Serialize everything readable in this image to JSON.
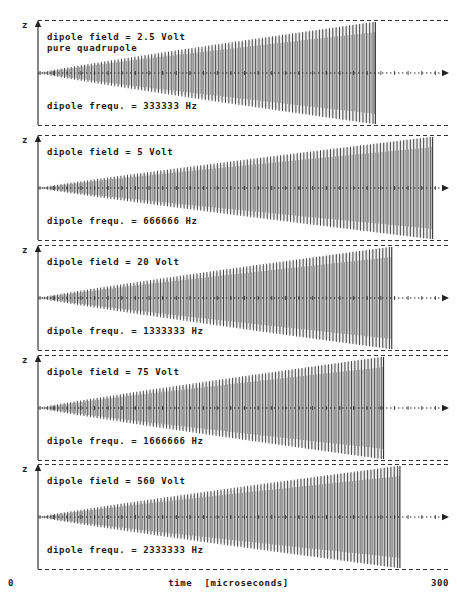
{
  "figure": {
    "yaxis_label": "z",
    "xaxis": {
      "title": "time  [microseconds]",
      "min_label": "0",
      "max_label": "300"
    }
  },
  "chart_data": {
    "type": "line",
    "title": "",
    "xlabel": "time  [microseconds]",
    "ylabel": "z",
    "xlim": [
      0,
      300
    ],
    "grid": false,
    "legend_position": "none",
    "panel_count": 5,
    "shared_x": [
      0,
      300
    ],
    "panels": [
      {
        "index": 1,
        "field_label": "dipole field = 2.5 Volt",
        "sub_label": "pure quadrupole",
        "freq_label": "dipole frequ. = 333333 Hz",
        "dipole_field_volt": 2.5,
        "dipole_frequency_hz": 333333,
        "eject_time_us": 246,
        "oscillation_cycles": 100,
        "envelope": "linear-growth-then-flat",
        "max_amplitude_fraction": 1.0
      },
      {
        "index": 2,
        "field_label": "dipole field = 5 Volt",
        "sub_label": "",
        "freq_label": "dipole frequ. = 666666 Hz",
        "dipole_field_volt": 5,
        "dipole_frequency_hz": 666666,
        "eject_time_us": 288,
        "oscillation_cycles": 118,
        "envelope": "linear-growth-then-flat",
        "max_amplitude_fraction": 1.0
      },
      {
        "index": 3,
        "field_label": "dipole field = 20 Volt",
        "sub_label": "",
        "freq_label": "dipole frequ. = 1333333 Hz",
        "dipole_field_volt": 20,
        "dipole_frequency_hz": 1333333,
        "eject_time_us": 258,
        "oscillation_cycles": 106,
        "envelope": "linear-growth-then-flat",
        "max_amplitude_fraction": 1.0
      },
      {
        "index": 4,
        "field_label": "dipole field = 75 Volt",
        "sub_label": "",
        "freq_label": "dipole frequ. = 1666666 Hz",
        "dipole_field_volt": 75,
        "dipole_frequency_hz": 1666666,
        "eject_time_us": 252,
        "oscillation_cycles": 104,
        "envelope": "linear-growth-then-flat",
        "max_amplitude_fraction": 1.0
      },
      {
        "index": 5,
        "field_label": "dipole field = 560 Volt",
        "sub_label": "",
        "freq_label": "dipole frequ. = 2333333 Hz",
        "dipole_field_volt": 560,
        "dipole_frequency_hz": 2333333,
        "eject_time_us": 264,
        "oscillation_cycles": 108,
        "envelope": "linear-growth-then-flat",
        "max_amplitude_fraction": 1.0
      }
    ]
  },
  "colors": {
    "trace": "#333333",
    "axis": "#222222",
    "boundary_dash": "#333333",
    "text": "#1a1a1a",
    "background": "#ffffff"
  }
}
